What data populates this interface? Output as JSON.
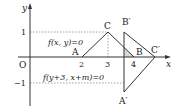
{
  "axes": {
    "x_label": "x",
    "y_label": "y",
    "origin_label": "O",
    "x_ticks": [
      "2",
      "3",
      "4"
    ],
    "y_ticks": [
      "1",
      "−1"
    ]
  },
  "points": {
    "A": "A",
    "B": "B",
    "C": "C",
    "A_prime": "A′",
    "B_prime": "B′",
    "C_prime": "C′"
  },
  "equations": {
    "upper": "f(x, y)=0",
    "lower": "f(y+3, x+m)=0"
  },
  "colors": {
    "line": "#333333",
    "shade": "#d8d8d8",
    "dotted": "#888888"
  }
}
